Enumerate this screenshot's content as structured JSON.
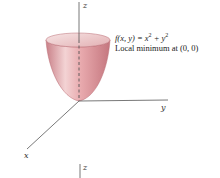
{
  "diagram": {
    "function_prefix": "f(x, y) = x",
    "function_mid": " + y",
    "exponent": "2",
    "caption": "Local minimum at (0, 0)",
    "axes": {
      "x": "x",
      "y": "y",
      "z": "z"
    },
    "bottom_axis_label": "z",
    "surface_color": "#e8a8ac",
    "surface_dark": "#c97a80",
    "axis_color": "#444444"
  }
}
